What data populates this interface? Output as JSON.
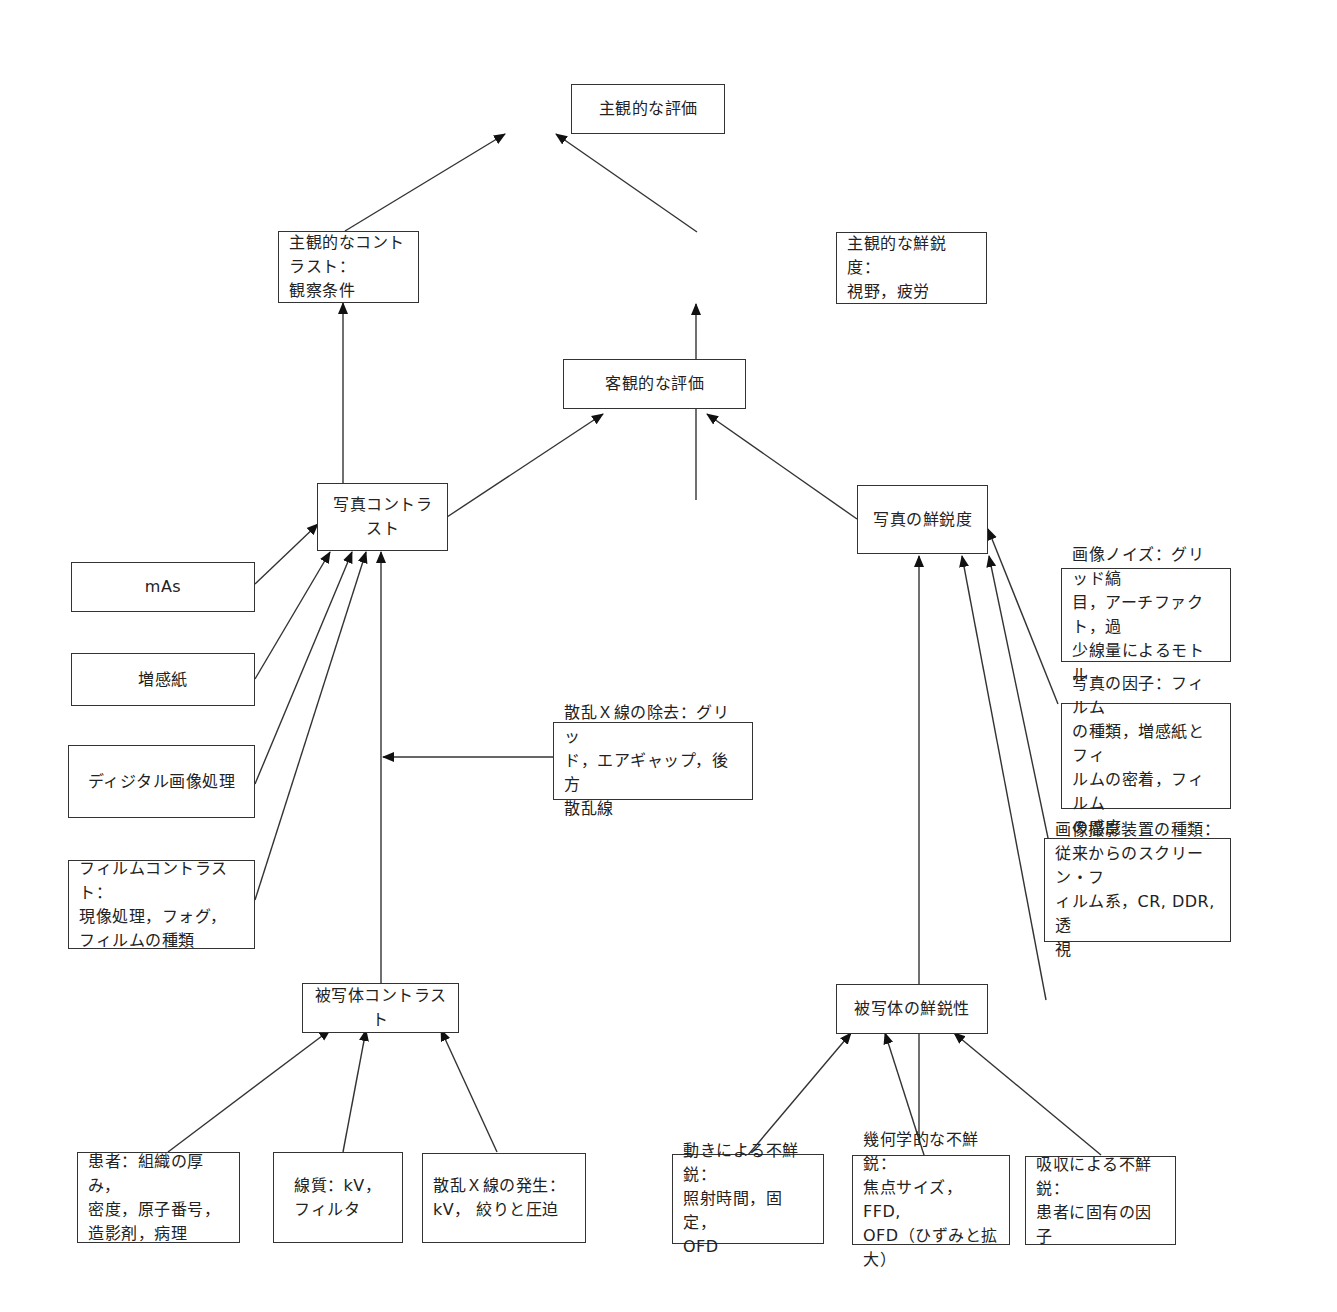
{
  "diagram": {
    "nodes": {
      "subjective_eval": "主観的な評価",
      "subjective_contrast": "主観的なコントラスト：\n観察条件",
      "subjective_sharpness": "主観的な鮮鋭度：\n視野，疲労",
      "objective_eval": "客観的な評価",
      "photo_contrast": "写真コントラスト",
      "photo_sharpness": "写真の鮮鋭度",
      "mas": "mAs",
      "intensifying_screen": "増感紙",
      "digital_processing": "ディジタル画像処理",
      "film_contrast": "フィルムコントラスト：\n現像処理，フォグ，\nフィルムの種類",
      "scatter_removal": "散乱Ｘ線の除去：グリッ\nド，エアギャップ，後方\n散乱線",
      "image_noise": "画像ノイズ：グリッド縞\n目，アーチファクト，過\n少線量によるモトル",
      "photo_factors": "写真の因子：フィルム\nの種類，増感紙とフィ\nルムの密着，フィルム\nの感度",
      "imaging_device": "画像撮影装置の種類：\n従来からのスクリーン・フ\nィルム系，CR, DDR, 透\n視",
      "subject_contrast": "被写体コントラスト",
      "subject_sharpness": "被写体の鮮鋭性",
      "patient": "患者：組織の厚み，\n密度，原子番号，\n造影剤，病理",
      "beam_quality": "線質：kV，\nフィルタ",
      "scatter_generation": "散乱Ｘ線の発生：\nkV，  絞りと圧迫",
      "motion_unsharpness": "動きによる不鮮鋭：\n照射時間，固定，\nOFD",
      "geometric_unsharpness": "幾何学的な不鮮鋭：\n焦点サイズ，FFD,\nOFD（ひずみと拡大）",
      "absorption_unsharpness": "吸収による不鮮鋭：\n患者に固有の因子"
    },
    "edges": [
      {
        "from": "subjective_contrast",
        "to": "subjective_eval"
      },
      {
        "from": "subjective_sharpness",
        "to": "subjective_eval"
      },
      {
        "from": "photo_contrast",
        "to": "subjective_contrast"
      },
      {
        "from": "photo_sharpness",
        "to": "subjective_sharpness"
      },
      {
        "from": "photo_contrast",
        "to": "objective_eval"
      },
      {
        "from": "photo_sharpness",
        "to": "objective_eval"
      },
      {
        "from": "mas",
        "to": "photo_contrast"
      },
      {
        "from": "intensifying_screen",
        "to": "photo_contrast"
      },
      {
        "from": "digital_processing",
        "to": "photo_contrast"
      },
      {
        "from": "film_contrast",
        "to": "photo_contrast"
      },
      {
        "from": "subject_contrast",
        "to": "photo_contrast"
      },
      {
        "from": "scatter_removal",
        "to": "subject_contrast_line"
      },
      {
        "from": "image_noise",
        "to": "photo_sharpness"
      },
      {
        "from": "photo_factors",
        "to": "photo_sharpness"
      },
      {
        "from": "imaging_device",
        "to": "photo_sharpness"
      },
      {
        "from": "subject_sharpness",
        "to": "photo_sharpness"
      },
      {
        "from": "patient",
        "to": "subject_contrast"
      },
      {
        "from": "beam_quality",
        "to": "subject_contrast"
      },
      {
        "from": "scatter_generation",
        "to": "subject_contrast"
      },
      {
        "from": "motion_unsharpness",
        "to": "subject_sharpness"
      },
      {
        "from": "geometric_unsharpness",
        "to": "subject_sharpness"
      },
      {
        "from": "absorption_unsharpness",
        "to": "subject_sharpness"
      }
    ],
    "colors": {
      "line": "#333333",
      "box_border": "#333333",
      "background": "#ffffff"
    }
  }
}
